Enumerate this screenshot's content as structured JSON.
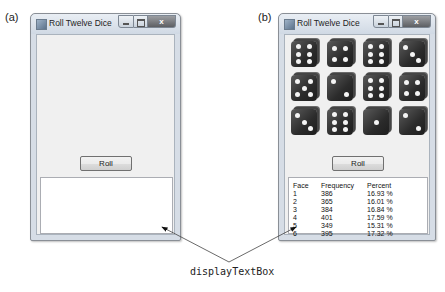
{
  "panels": [
    {
      "label": "(a)",
      "window": {
        "title": "Roll Twelve Dice",
        "close_glyph": "x"
      },
      "roll_button": "Roll",
      "display_text": ""
    },
    {
      "label": "(b)",
      "window": {
        "title": "Roll Twelve Dice",
        "close_glyph": "x"
      },
      "dice_faces": [
        6,
        4,
        6,
        3,
        5,
        2,
        6,
        4,
        3,
        6,
        1,
        2
      ],
      "roll_button": "Roll",
      "table": {
        "headers": [
          "Face",
          "Frequency",
          "Percent"
        ],
        "rows": [
          [
            "1",
            "386",
            "16.93 %"
          ],
          [
            "2",
            "365",
            "16.01 %"
          ],
          [
            "3",
            "384",
            "16.84 %"
          ],
          [
            "4",
            "401",
            "17.59 %"
          ],
          [
            "5",
            "349",
            "15.31 %"
          ],
          [
            "6",
            "395",
            "17.32 %"
          ]
        ]
      }
    }
  ],
  "callout": {
    "label": "displayTextBox"
  },
  "icons": {
    "app": "window-app-icon",
    "minimize": "minimize-icon",
    "maximize": "maximize-icon",
    "close": "close-icon"
  }
}
